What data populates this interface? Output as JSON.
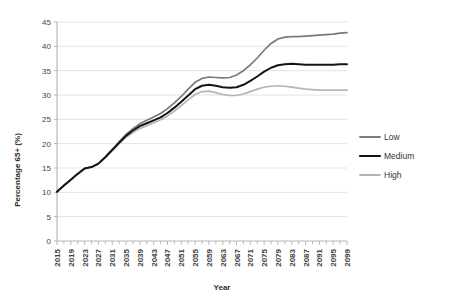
{
  "chart_data": {
    "type": "line",
    "title": "",
    "xlabel": "Year",
    "ylabel": "Percentage 65+ (%)",
    "ylim": [
      0,
      45
    ],
    "ytick_step": 5,
    "yticks": [
      0,
      5,
      10,
      15,
      20,
      25,
      30,
      35,
      40,
      45
    ],
    "grid": true,
    "legend_position": "right",
    "x_tick_labels": [
      "2015",
      "2019",
      "2023",
      "2027",
      "2031",
      "2035",
      "2039",
      "2043",
      "2047",
      "2051",
      "2055",
      "2059",
      "2063",
      "2067",
      "2071",
      "2075",
      "2079",
      "2083",
      "2087",
      "2091",
      "2095",
      "2099"
    ],
    "x": [
      2015,
      2017,
      2019,
      2021,
      2023,
      2025,
      2027,
      2029,
      2031,
      2033,
      2035,
      2037,
      2039,
      2041,
      2043,
      2045,
      2047,
      2049,
      2051,
      2053,
      2055,
      2057,
      2059,
      2061,
      2063,
      2065,
      2067,
      2069,
      2071,
      2073,
      2075,
      2077,
      2079,
      2081,
      2083,
      2085,
      2087,
      2089,
      2091,
      2093,
      2095,
      2097,
      2099
    ],
    "series": [
      {
        "name": "Low",
        "color": "#7a7a7a",
        "values": [
          10.1,
          11.4,
          12.6,
          13.8,
          14.9,
          15.2,
          15.9,
          17.3,
          18.8,
          20.4,
          21.9,
          23.1,
          24.1,
          24.8,
          25.5,
          26.2,
          27.2,
          28.4,
          29.7,
          31.2,
          32.6,
          33.4,
          33.7,
          33.6,
          33.5,
          33.6,
          34.1,
          35.0,
          36.2,
          37.6,
          39.2,
          40.6,
          41.5,
          41.9,
          42.0,
          42.0,
          42.1,
          42.2,
          42.3,
          42.4,
          42.5,
          42.7,
          42.8
        ]
      },
      {
        "name": "Medium",
        "color": "#141414",
        "values": [
          10.1,
          11.4,
          12.6,
          13.8,
          14.9,
          15.2,
          15.9,
          17.2,
          18.7,
          20.2,
          21.6,
          22.7,
          23.6,
          24.2,
          24.8,
          25.4,
          26.3,
          27.4,
          28.6,
          29.9,
          31.2,
          31.9,
          32.1,
          31.9,
          31.6,
          31.5,
          31.6,
          32.1,
          32.9,
          33.8,
          34.8,
          35.6,
          36.1,
          36.3,
          36.4,
          36.3,
          36.2,
          36.2,
          36.2,
          36.2,
          36.2,
          36.3,
          36.3
        ]
      },
      {
        "name": "High",
        "color": "#b5b5b5",
        "values": [
          10.1,
          11.4,
          12.6,
          13.8,
          14.9,
          15.2,
          15.9,
          17.2,
          18.6,
          20.0,
          21.3,
          22.3,
          23.1,
          23.7,
          24.3,
          24.9,
          25.7,
          26.7,
          27.8,
          29.0,
          30.1,
          30.7,
          30.8,
          30.5,
          30.1,
          29.9,
          29.9,
          30.2,
          30.7,
          31.2,
          31.6,
          31.8,
          31.9,
          31.8,
          31.6,
          31.4,
          31.2,
          31.1,
          31.0,
          31.0,
          31.0,
          31.0,
          31.0
        ]
      }
    ]
  },
  "legend": {
    "items": [
      {
        "label": "Low"
      },
      {
        "label": "Medium"
      },
      {
        "label": "High"
      }
    ]
  }
}
